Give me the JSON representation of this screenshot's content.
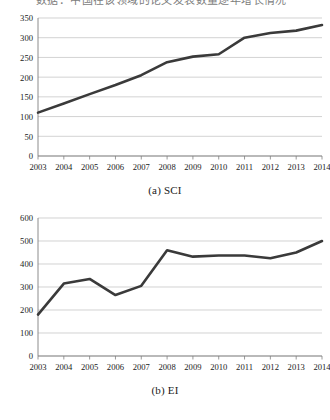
{
  "page": {
    "top_cut_text": "数据：中国在该领域的论文发表数量逐年增长情况"
  },
  "colors": {
    "line": "#3a3a3a",
    "grid": "#bfbfbf",
    "axis": "#808080",
    "tick_label": "#1a1a1a",
    "background": "#ffffff"
  },
  "figures": [
    {
      "id": "a",
      "caption": "(a) SCI",
      "chart_index": 0
    },
    {
      "id": "b",
      "caption": "(b) EI",
      "chart_index": 1
    }
  ],
  "chart_data": [
    {
      "type": "line",
      "title": "(a) SCI",
      "xlabel": "",
      "ylabel": "",
      "categories": [
        "2003",
        "2004",
        "2005",
        "2006",
        "2007",
        "2008",
        "2009",
        "2010",
        "2011",
        "2012",
        "2013",
        "2014"
      ],
      "x": [
        2003,
        2004,
        2005,
        2006,
        2007,
        2008,
        2009,
        2010,
        2011,
        2012,
        2013,
        2014
      ],
      "values": [
        110,
        133,
        157,
        180,
        205,
        238,
        252,
        258,
        300,
        312,
        318,
        332
      ],
      "ylim": [
        0,
        350
      ],
      "yticks": [
        0,
        50,
        100,
        150,
        200,
        250,
        300,
        350
      ],
      "xticks": [
        "2003",
        "2004",
        "2005",
        "2006",
        "2007",
        "2008",
        "2009",
        "2010",
        "2011",
        "2012",
        "2013",
        "2014"
      ],
      "grid": true,
      "legend": false,
      "series": [
        {
          "name": "SCI",
          "values": [
            110,
            133,
            157,
            180,
            205,
            238,
            252,
            258,
            300,
            312,
            318,
            332
          ]
        }
      ]
    },
    {
      "type": "line",
      "title": "(b) EI",
      "xlabel": "",
      "ylabel": "",
      "categories": [
        "2003",
        "2004",
        "2005",
        "2006",
        "2007",
        "2008",
        "2009",
        "2010",
        "2011",
        "2012",
        "2013",
        "2014"
      ],
      "x": [
        2003,
        2004,
        2005,
        2006,
        2007,
        2008,
        2009,
        2010,
        2011,
        2012,
        2013,
        2014
      ],
      "values": [
        180,
        315,
        335,
        265,
        305,
        460,
        432,
        437,
        437,
        425,
        450,
        500
      ],
      "ylim": [
        0,
        600
      ],
      "yticks": [
        0,
        100,
        200,
        300,
        400,
        500,
        600
      ],
      "xticks": [
        "2003",
        "2004",
        "2005",
        "2006",
        "2007",
        "2008",
        "2009",
        "2010",
        "2011",
        "2012",
        "2013",
        "2014"
      ],
      "grid": true,
      "legend": false,
      "series": [
        {
          "name": "EI",
          "values": [
            180,
            315,
            335,
            265,
            305,
            460,
            432,
            437,
            437,
            425,
            450,
            500
          ]
        }
      ]
    }
  ]
}
